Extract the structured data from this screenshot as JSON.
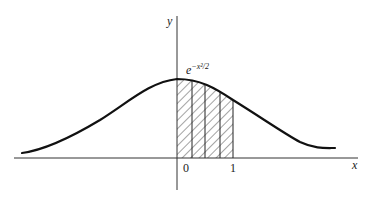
{
  "figure": {
    "y_axis_label": "y",
    "x_axis_label": "x",
    "curve_label_base": "e",
    "curve_label_exponent": "−x²/2",
    "tick_labels": [
      "0",
      "1"
    ],
    "shaded_interval": [
      0,
      1
    ],
    "shaded_strips": 4,
    "colors": {
      "ink": "#1a1a1a",
      "background": "#ffffff"
    }
  }
}
